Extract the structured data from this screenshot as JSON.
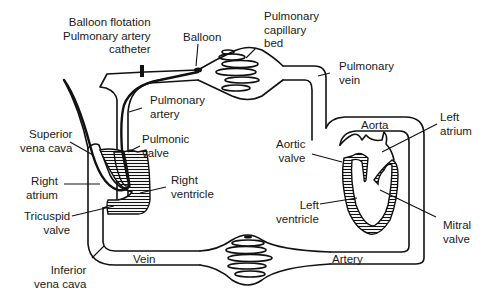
{
  "diagram": {
    "colors": {
      "line": "#111111",
      "background": "#ffffff"
    },
    "labels": {
      "catheter": "Balloon flotation\nPulmonary artery\ncatheter",
      "balloon": "Balloon",
      "pulmonary_capillary_bed": "Pulmonary\ncapillary\nbed",
      "pulmonary_vein": "Pulmonary\nvein",
      "pulmonary_artery": "Pulmonary\nartery",
      "pulmonic_valve": "Pulmonic\nvalve",
      "superior_vena_cava": "Superior\nvena cava",
      "right_atrium": "Right\natrium",
      "right_ventricle": "Right\nventricle",
      "tricuspid_valve": "Tricuspid\nvalve",
      "inferior_vena_cava": "Inferior\nvena cava",
      "vein": "Vein",
      "artery": "Artery",
      "aorta": "Aorta",
      "left_atrium": "Left\natrium",
      "aortic_valve": "Aortic\nvalve",
      "left_ventricle": "Left\nventricle",
      "mitral_valve": "Mitral\nvalve"
    }
  }
}
